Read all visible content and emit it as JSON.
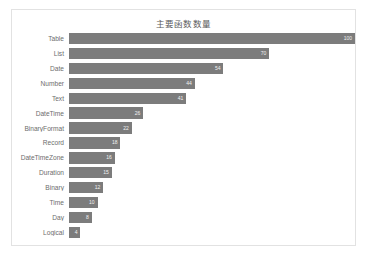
{
  "chart_data": {
    "type": "bar",
    "orientation": "horizontal",
    "title": "主要函数数量",
    "xlabel": "",
    "ylabel": "",
    "categories": [
      "Table",
      "List",
      "Date",
      "Number",
      "Text",
      "DateTime",
      "BinaryFormat",
      "Record",
      "DateTimeZone",
      "Duration",
      "Binary",
      "Time",
      "Day",
      "Logical"
    ],
    "values": [
      100,
      70,
      54,
      44,
      41,
      26,
      22,
      18,
      16,
      15,
      12,
      10,
      8,
      4
    ],
    "xlim": [
      0,
      100
    ],
    "grid": false,
    "legend": false,
    "bar_color": "#7c7c7c",
    "value_label_color": "#f2f2f2",
    "background_color": "#ffffff",
    "border_color": "#e2e2e2"
  }
}
